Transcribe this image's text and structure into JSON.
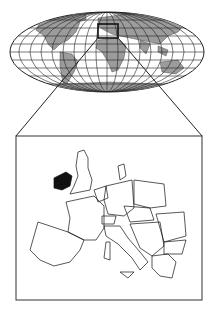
{
  "diagram": {
    "world_map": {
      "projection": "elliptical graticule",
      "land_color": "#9a9a9a",
      "grid_color": "#222222"
    },
    "locator_box": {
      "region": "Europe"
    },
    "inset_map": {
      "region": "Europe",
      "highlighted_country": "Ireland",
      "highlight_color": "#111111"
    }
  }
}
